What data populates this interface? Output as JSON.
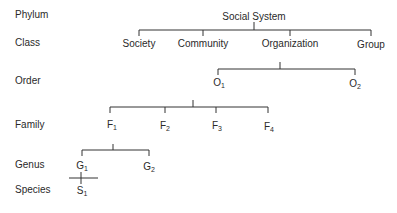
{
  "ranks": [
    "Phylum",
    "Class",
    "Order",
    "Family",
    "Genus",
    "Species"
  ],
  "tree": {
    "root": "Social System",
    "classes": [
      "Society",
      "Community",
      "Organization",
      "Group"
    ],
    "orders": [
      {
        "base": "O",
        "sub": "1"
      },
      {
        "base": "O",
        "sub": "2"
      }
    ],
    "families": [
      {
        "base": "F",
        "sub": "1"
      },
      {
        "base": "F",
        "sub": "2"
      },
      {
        "base": "F",
        "sub": "3"
      },
      {
        "base": "F",
        "sub": "4"
      }
    ],
    "genera": [
      {
        "base": "G",
        "sub": "1"
      },
      {
        "base": "G",
        "sub": "2"
      }
    ],
    "species": [
      {
        "base": "S",
        "sub": "1"
      }
    ]
  }
}
